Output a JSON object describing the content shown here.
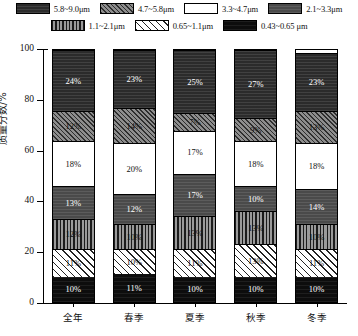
{
  "chart_data": {
    "type": "bar",
    "subtype": "stacked-100-percent",
    "title": "",
    "xlabel": "",
    "ylabel": "质量分数/%",
    "ylim": [
      0,
      100
    ],
    "yticks": [
      0,
      20,
      40,
      60,
      80,
      100
    ],
    "ytick_labels": [
      "0",
      "20",
      "40",
      "60",
      "80",
      "100"
    ],
    "grid": false,
    "legend_position": "top",
    "categories": [
      "全年",
      "春季",
      "夏季",
      "秋季",
      "冬季"
    ],
    "series": [
      {
        "name": "0.43~0.65μm",
        "pattern": "solid-black",
        "values": [
          10,
          11,
          10,
          10,
          10
        ],
        "labels": [
          "10%",
          "11%",
          "10%",
          "10%",
          "10%"
        ]
      },
      {
        "name": "0.65~1.1μm",
        "pattern": "diagonal-hatch-white",
        "values": [
          11,
          10,
          11,
          13,
          11
        ],
        "labels": [
          "11%",
          "10%",
          "11%",
          "13%",
          "11%"
        ]
      },
      {
        "name": "1.1~2.1μm",
        "pattern": "vertical-stripes",
        "values": [
          12,
          10,
          13,
          13,
          10
        ],
        "labels": [
          "12%",
          "10%",
          "13%",
          "13%",
          "10%"
        ]
      },
      {
        "name": "2.1~3.3μm",
        "pattern": "medium-dark-gray",
        "values": [
          13,
          12,
          17,
          10,
          14
        ],
        "labels": [
          "13%",
          "12%",
          "17%",
          "10%",
          "14%"
        ]
      },
      {
        "name": "3.3~4.7μm",
        "pattern": "white",
        "values": [
          18,
          20,
          17,
          18,
          18
        ],
        "labels": [
          "18%",
          "20%",
          "17%",
          "18%",
          "18%"
        ]
      },
      {
        "name": "4.7~5.8μm",
        "pattern": "dense-diagonal-gray",
        "values": [
          12,
          14,
          7,
          9,
          13
        ],
        "labels": [
          "12%",
          "14%",
          "7%",
          "9%",
          "13%"
        ]
      },
      {
        "name": "5.8~9.0μm",
        "pattern": "dark-near-black",
        "values": [
          24,
          23,
          25,
          27,
          23
        ],
        "labels": [
          "24%",
          "23%",
          "25%",
          "27%",
          "23%"
        ]
      }
    ]
  },
  "legend": {
    "rows": [
      [
        {
          "label": "5.8~9.0μm",
          "pattern_class": "p-58-90"
        },
        {
          "label": "4.7~5.8μm",
          "pattern_class": "p-47-58"
        },
        {
          "label": "3.3~4.7μm",
          "pattern_class": "p-33-47"
        },
        {
          "label": "2.1~3.3μm",
          "pattern_class": "p-21-33"
        }
      ],
      [
        {
          "label": "1.1~2.1μm",
          "pattern_class": "p-11-21"
        },
        {
          "label": "0.65~1.1μm",
          "pattern_class": "p-065-11"
        },
        {
          "label": "0.43~0.65 μm",
          "pattern_class": "p-043-065"
        }
      ]
    ]
  },
  "style": {
    "axis_color": "#000000",
    "background": "#ffffff",
    "label_light": "#ffffff",
    "label_dark": "#111111"
  }
}
